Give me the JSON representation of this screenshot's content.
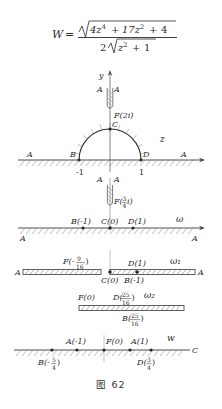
{
  "figure": {
    "caption": "图 62",
    "formula": {
      "lhs": "W",
      "eq": "=",
      "numerator": "4z⁴ + 17z² + 4",
      "numerator_radical": "√",
      "denominator_coefficient": "2",
      "denominator_radical": "√",
      "denominator_inner": "z² + 1",
      "num_base1": "4z",
      "num_exp1": "4",
      "num_plus1": "+",
      "num_base2": "17z",
      "num_exp2": "2",
      "num_plus2": "+",
      "num_const": "4",
      "den_base": "z",
      "den_exp": "2",
      "den_plus": "+",
      "den_const": "1"
    },
    "panels": [
      {
        "id": "panel-z",
        "plane_label": "z",
        "axis_x_label": "x",
        "axis_y_label": "y",
        "labels": [
          {
            "name": "slit-left-A",
            "text": "A"
          },
          {
            "name": "slit-right-A",
            "text": "A"
          },
          {
            "name": "slit-tip-F",
            "text": "F(2i)"
          },
          {
            "name": "arc-top-C",
            "text": "C"
          },
          {
            "name": "arc-left-B",
            "text": "B"
          },
          {
            "name": "arc-right-D",
            "text": "D"
          },
          {
            "name": "tick-minus-one",
            "text": "-1"
          },
          {
            "name": "tick-one",
            "text": "1"
          },
          {
            "name": "axis-far-left-A",
            "text": "A"
          },
          {
            "name": "axis-far-right-A",
            "text": "A"
          }
        ]
      },
      {
        "id": "panel-omega",
        "plane_label": "ω",
        "labels": [
          {
            "name": "slit-left-A",
            "text": "A"
          },
          {
            "name": "slit-right-A",
            "text": "A"
          },
          {
            "name": "slit-tip-F",
            "text": "F(",
            "frac_num": "3",
            "frac_den": "4",
            "tail": "i)"
          },
          {
            "name": "point-B",
            "text": "B(-1)"
          },
          {
            "name": "point-C",
            "text": "C(0)"
          },
          {
            "name": "point-D",
            "text": "D(1)"
          },
          {
            "name": "axis-far-left-A",
            "text": "A"
          },
          {
            "name": "axis-far-right-A",
            "text": "A"
          }
        ]
      },
      {
        "id": "panel-omega-1",
        "plane_label": "ω₁",
        "labels": [
          {
            "name": "point-F",
            "text": "F(-",
            "frac_num": "9",
            "frac_den": "16",
            "tail": ")"
          },
          {
            "name": "point-D",
            "text": "D(1)"
          },
          {
            "name": "point-C",
            "text": "C(0)"
          },
          {
            "name": "point-B",
            "text": "B(-1)"
          },
          {
            "name": "axis-far-left-A",
            "text": "A"
          },
          {
            "name": "axis-far-right-A",
            "text": "A"
          }
        ]
      },
      {
        "id": "panel-omega-2",
        "plane_label": "ω₂",
        "labels": [
          {
            "name": "point-F",
            "text": "F(0)"
          },
          {
            "name": "point-D",
            "text": "D(",
            "frac_num": "25",
            "frac_den": "16",
            "tail": ")"
          },
          {
            "name": "point-B",
            "text": "B(",
            "frac_num": "25",
            "frac_den": "16",
            "tail": ")"
          }
        ]
      },
      {
        "id": "panel-w",
        "plane_label": "w",
        "end_label": "C",
        "labels": [
          {
            "name": "point-A-left",
            "text": "A(-1)"
          },
          {
            "name": "point-F",
            "text": "F(0)"
          },
          {
            "name": "point-A-right",
            "text": "A(1)"
          },
          {
            "name": "point-B",
            "text": "B(-",
            "frac_num": "5",
            "frac_den": "4",
            "tail": ")"
          },
          {
            "name": "point-D",
            "text": "D(",
            "frac_num": "3",
            "frac_den": "4",
            "tail": ")"
          }
        ]
      }
    ],
    "colors": {
      "ink": "#2a2a2a",
      "line": "#3a3a3a",
      "background": "#ffffff"
    }
  }
}
